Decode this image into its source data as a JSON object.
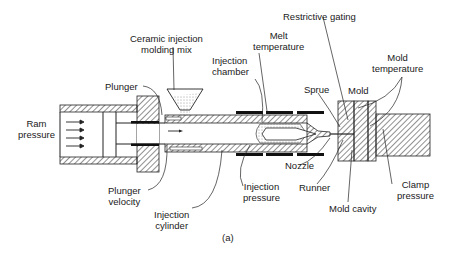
{
  "diagram": {
    "caption": "(a)",
    "labels": {
      "ceramic_mix_1": "Ceramic injection",
      "ceramic_mix_2": "molding mix",
      "restrictive_gating": "Restrictive gating",
      "melt_temp_1": "Melt",
      "melt_temp_2": "temperature",
      "injection_chamber_1": "Injection",
      "injection_chamber_2": "chamber",
      "mold_temp_1": "Mold",
      "mold_temp_2": "temperature",
      "plunger": "Plunger",
      "sprue": "Sprue",
      "mold": "Mold",
      "ram_pressure_1": "Ram",
      "ram_pressure_2": "pressure",
      "nozzle": "Nozzle",
      "plunger_velocity_1": "Plunger",
      "plunger_velocity_2": "velocity",
      "injection_pressure_1": "Injection",
      "injection_pressure_2": "pressure",
      "runner": "Runner",
      "clamp_pressure_1": "Clamp",
      "clamp_pressure_2": "pressure",
      "mold_cavity": "Mold cavity",
      "injection_cylinder_1": "Injection",
      "injection_cylinder_2": "cylinder"
    }
  }
}
